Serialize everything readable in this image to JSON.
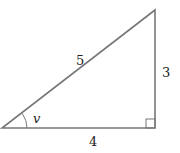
{
  "diagram": {
    "type": "right-triangle",
    "line_color": "#777777",
    "vertices": {
      "bottom_left": [
        2,
        128
      ],
      "bottom_right": [
        155,
        128
      ],
      "top_right": [
        155,
        10
      ]
    },
    "labels": {
      "hypotenuse": "5",
      "vertical_side": "3",
      "horizontal_side": "4",
      "angle": "v"
    }
  }
}
